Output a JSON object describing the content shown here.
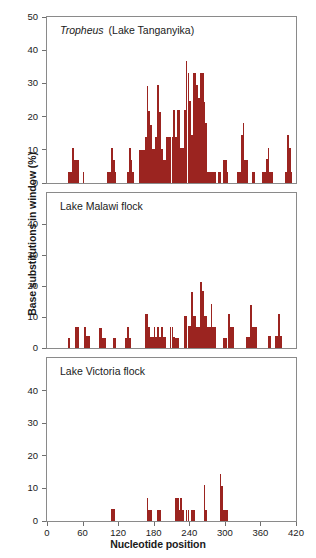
{
  "figure": {
    "ylabel": "Base substitutions in window (%)",
    "xlabel": "Nucleotide position",
    "bar_color": "#9B2420",
    "axis_color": "#8a8a8a",
    "text_color": "#1a1a1a"
  },
  "panels": [
    {
      "id": "tropheus",
      "title_italic": "Tropheus",
      "title_rest": "(Lake Tanganyika)",
      "title_full": "Tropheus  (Lake Tanganyika)",
      "yticks": [
        0,
        10,
        20,
        30,
        40,
        50
      ],
      "ylim": [
        0,
        50
      ]
    },
    {
      "id": "malawi",
      "title_italic": "",
      "title_rest": "Lake Malawi flock",
      "title_full": "Lake Malawi flock",
      "yticks": [
        0,
        10,
        20,
        30,
        40
      ],
      "ylim": [
        0,
        50
      ]
    },
    {
      "id": "victoria",
      "title_italic": "",
      "title_rest": "Lake Victoria flock",
      "title_full": "Lake Victoria flock",
      "yticks": [
        0,
        10,
        20,
        30,
        40
      ],
      "ylim": [
        0,
        50
      ]
    }
  ],
  "xticks": [
    0,
    60,
    120,
    180,
    240,
    300,
    360,
    420
  ],
  "chart_data": {
    "type": "bar",
    "xlabel": "Nucleotide position",
    "ylabel": "Base substitutions in window (%)",
    "xlim": [
      0,
      420
    ],
    "grid": false,
    "legend": "none",
    "bin_width": 3,
    "panels": [
      {
        "name": "Tropheus  (Lake Tanganyika)",
        "ylim": [
          0,
          50
        ],
        "yticks": [
          0,
          10,
          20,
          30,
          40,
          50
        ],
        "x": [
          36,
          39,
          42,
          45,
          48,
          51,
          54,
          57,
          60,
          63,
          66,
          69,
          72,
          75,
          78,
          81,
          84,
          87,
          90,
          93,
          96,
          99,
          102,
          105,
          108,
          111,
          114,
          117,
          120,
          123,
          126,
          129,
          132,
          135,
          138,
          141,
          144,
          147,
          150,
          153,
          156,
          159,
          162,
          165,
          168,
          171,
          174,
          177,
          180,
          183,
          186,
          189,
          192,
          195,
          198,
          201,
          204,
          207,
          210,
          213,
          216,
          219,
          222,
          225,
          228,
          231,
          234,
          237,
          240,
          243,
          246,
          249,
          252,
          255,
          258,
          261,
          264,
          267,
          270,
          273,
          276,
          279,
          282,
          285,
          288,
          291,
          294,
          297,
          300,
          303,
          306,
          309,
          312,
          315,
          318,
          321,
          324,
          327,
          330,
          333,
          336,
          339,
          342,
          345,
          348,
          351,
          354,
          357,
          360,
          363,
          366,
          369,
          372,
          375,
          378,
          381,
          384,
          387,
          390,
          393,
          396,
          399,
          402,
          405,
          408,
          411,
          414,
          417
        ],
        "values": [
          3.3,
          3.3,
          10.4,
          6.8,
          6.8,
          6.8,
          0,
          0,
          3.3,
          0,
          0,
          0,
          0,
          0,
          0,
          0,
          0,
          0,
          0,
          0,
          0,
          0,
          3.3,
          3.3,
          10.4,
          7.0,
          3.3,
          0,
          0,
          0,
          0,
          0,
          0,
          3.3,
          10.4,
          6.9,
          3.3,
          0,
          0,
          0,
          10.0,
          10.0,
          10.0,
          13.8,
          29.3,
          21.8,
          17.5,
          10.2,
          10.2,
          13.8,
          29.4,
          21.5,
          10.2,
          7.0,
          7.0,
          13.9,
          13.9,
          13.9,
          13.9,
          22.0,
          13.9,
          22.0,
          22.0,
          10.5,
          10.5,
          22.0,
          36.9,
          33.0,
          24.6,
          14.5,
          33.0,
          33.0,
          29.5,
          25.5,
          33.0,
          33.0,
          24.5,
          18.0,
          3.3,
          3.3,
          3.3,
          3.3,
          3.3,
          0,
          3.3,
          3.3,
          0,
          6.8,
          6.8,
          3.3,
          0,
          0,
          0,
          0,
          0,
          3.3,
          3.3,
          14.6,
          18.2,
          6.8,
          6.8,
          0,
          0,
          3.3,
          3.3,
          0,
          0,
          0,
          0,
          3.3,
          3.3,
          7.3,
          10.5,
          3.3,
          3.3,
          0,
          0,
          0,
          0,
          0,
          0,
          0,
          3.3,
          14.6,
          10.6,
          3.3,
          0,
          0
        ]
      },
      {
        "name": "Lake Malawi flock",
        "ylim": [
          0,
          50
        ],
        "yticks": [
          0,
          10,
          20,
          30,
          40
        ],
        "x": [
          36,
          39,
          42,
          45,
          48,
          51,
          54,
          57,
          60,
          63,
          66,
          69,
          72,
          75,
          78,
          81,
          84,
          87,
          90,
          93,
          96,
          99,
          102,
          105,
          108,
          111,
          114,
          117,
          120,
          123,
          126,
          129,
          132,
          135,
          138,
          141,
          144,
          147,
          150,
          153,
          156,
          159,
          162,
          165,
          168,
          171,
          174,
          177,
          180,
          183,
          186,
          189,
          192,
          195,
          198,
          201,
          204,
          207,
          210,
          213,
          216,
          219,
          222,
          225,
          228,
          231,
          234,
          237,
          240,
          243,
          246,
          249,
          252,
          255,
          258,
          261,
          264,
          267,
          270,
          273,
          276,
          279,
          282,
          285,
          288,
          291,
          294,
          297,
          300,
          303,
          306,
          309,
          312,
          315,
          318,
          321,
          324,
          327,
          330,
          333,
          336,
          339,
          342,
          345,
          348,
          351,
          354,
          357,
          360,
          363,
          366,
          369,
          372,
          375,
          378,
          381,
          384,
          387,
          390,
          393,
          396,
          399,
          402,
          405,
          408,
          411,
          414,
          417
        ],
        "values": [
          3.3,
          0,
          0,
          0,
          6.7,
          6.7,
          0,
          0,
          0,
          6.7,
          3.9,
          3.9,
          0,
          0,
          0,
          0,
          0,
          6.6,
          6.6,
          3.3,
          3.3,
          0,
          0,
          0,
          0,
          3.3,
          3.3,
          0,
          0,
          0,
          0,
          0,
          3.3,
          6.7,
          3.3,
          0,
          0,
          0,
          0,
          0,
          0,
          0,
          0,
          11.0,
          11.0,
          6.8,
          3.4,
          3.4,
          6.8,
          3.4,
          6.8,
          3.4,
          6.8,
          3.4,
          3.4,
          0,
          0,
          6.8,
          6.8,
          3.4,
          3.3,
          3.3,
          0,
          0,
          0,
          10.4,
          10.4,
          7.0,
          7.0,
          18.0,
          10.4,
          10.4,
          6.9,
          6.9,
          21.2,
          18.4,
          10.4,
          10.4,
          6.9,
          6.9,
          14.3,
          6.9,
          6.9,
          0,
          0,
          0,
          0,
          3.3,
          3.3,
          0,
          11.0,
          6.8,
          6.8,
          0,
          0,
          0,
          0,
          0,
          0,
          0,
          3.4,
          3.4,
          14.0,
          6.9,
          6.9,
          6.9,
          0,
          0,
          0,
          0,
          0,
          0,
          3.9,
          3.9,
          0,
          0,
          3.8,
          3.8,
          10.9,
          3.8,
          0,
          0,
          0,
          0,
          0,
          0,
          0,
          0
        ]
      },
      {
        "name": "Lake Victoria flock",
        "ylim": [
          0,
          50
        ],
        "yticks": [
          0,
          10,
          20,
          30,
          40
        ],
        "x": [
          36,
          39,
          42,
          45,
          48,
          51,
          54,
          57,
          60,
          63,
          66,
          69,
          72,
          75,
          78,
          81,
          84,
          87,
          90,
          93,
          96,
          99,
          102,
          105,
          108,
          111,
          114,
          117,
          120,
          123,
          126,
          129,
          132,
          135,
          138,
          141,
          144,
          147,
          150,
          153,
          156,
          159,
          162,
          165,
          168,
          171,
          174,
          177,
          180,
          183,
          186,
          189,
          192,
          195,
          198,
          201,
          204,
          207,
          210,
          213,
          216,
          219,
          222,
          225,
          228,
          231,
          234,
          237,
          240,
          243,
          246,
          249,
          252,
          255,
          258,
          261,
          264,
          267,
          270,
          273,
          276,
          279,
          282,
          285,
          288,
          291,
          294,
          297,
          300,
          303,
          306,
          309,
          312,
          315,
          318,
          321,
          324,
          327,
          330,
          333,
          336,
          339,
          342,
          345,
          348,
          351,
          354,
          357,
          360,
          363,
          366,
          369,
          372,
          375,
          378,
          381,
          384,
          387,
          390,
          393,
          396,
          399,
          402,
          405,
          408,
          411,
          414,
          417
        ],
        "values": [
          0,
          0,
          0,
          0,
          0,
          0,
          0,
          0,
          0,
          0,
          0,
          0,
          0,
          0,
          0,
          0,
          0,
          0,
          0,
          0,
          0,
          0,
          0,
          0,
          3.6,
          3.6,
          0,
          0,
          0,
          0,
          0,
          0,
          0,
          0,
          0,
          0,
          0,
          0,
          0,
          0,
          0,
          0,
          0,
          0,
          7.0,
          3.5,
          3.5,
          0,
          0,
          0,
          3.5,
          3.5,
          0,
          0,
          0,
          0,
          0,
          0,
          0,
          0,
          7.0,
          7.0,
          3.5,
          7.0,
          3.5,
          0,
          3.5,
          3.5,
          0,
          3.5,
          3.5,
          0,
          0,
          0,
          0,
          0,
          11.2,
          3.5,
          0,
          0,
          0,
          0,
          0,
          0,
          0,
          14.5,
          10.8,
          3.5,
          3.5,
          3.5,
          0,
          0,
          0,
          0,
          0,
          0,
          0,
          0,
          0,
          0,
          0,
          0,
          0,
          0,
          0,
          0,
          0,
          0,
          0,
          0,
          0,
          0,
          0,
          0,
          0,
          0,
          0,
          0,
          0,
          0,
          0,
          0,
          0,
          0,
          0,
          0,
          0,
          0
        ]
      }
    ]
  }
}
